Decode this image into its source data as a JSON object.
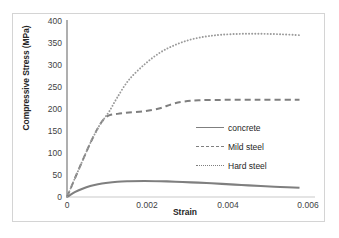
{
  "chart_data": {
    "type": "line",
    "title": "",
    "xlabel": "Strain",
    "ylabel": "Compressive Stress (MPa)",
    "xlim": [
      0,
      0.0064
    ],
    "ylim": [
      0,
      400
    ],
    "xticks": [
      "0",
      "0.002",
      "0.004",
      "0.006"
    ],
    "xtick_values": [
      0,
      0.002,
      0.004,
      0.006
    ],
    "yticks": [
      "0",
      "50",
      "100",
      "150",
      "200",
      "250",
      "300",
      "350",
      "400"
    ],
    "ytick_values": [
      0,
      50,
      100,
      150,
      200,
      250,
      300,
      350,
      400
    ],
    "grid": false,
    "legend_position": "center-right",
    "series": [
      {
        "name": "concrete",
        "style": "solid",
        "color": "#7f7f7f",
        "x": [
          0,
          0.0002,
          0.0004,
          0.0006,
          0.0008,
          0.001,
          0.0013,
          0.0016,
          0.002,
          0.0024,
          0.0028,
          0.0032,
          0.0036,
          0.004,
          0.0045,
          0.005,
          0.0055,
          0.006
        ],
        "y": [
          0,
          11,
          19,
          25,
          29,
          32,
          35,
          36,
          36.5,
          36,
          35,
          33.5,
          32,
          30,
          27.5,
          25,
          23,
          21
        ]
      },
      {
        "name": "Mild steel",
        "style": "dashed",
        "color": "#7f7f7f",
        "x": [
          0,
          0.0002,
          0.0004,
          0.0006,
          0.0008,
          0.00095,
          0.0011,
          0.0013,
          0.0016,
          0.002,
          0.0024,
          0.0027,
          0.003,
          0.0034,
          0.004,
          0.0046,
          0.0052,
          0.006
        ],
        "y": [
          0,
          42,
          83,
          123,
          158,
          178,
          187,
          190,
          193,
          196,
          203,
          212,
          218,
          221,
          222,
          222,
          222,
          222
        ]
      },
      {
        "name": "Hard steel",
        "style": "dotted",
        "color": "#9a9a9a",
        "x": [
          0,
          0.0002,
          0.0004,
          0.0006,
          0.0008,
          0.00095,
          0.0011,
          0.0013,
          0.0016,
          0.002,
          0.0024,
          0.0028,
          0.0032,
          0.0036,
          0.004,
          0.0045,
          0.005,
          0.0055,
          0.006
        ],
        "y": [
          0,
          42,
          83,
          123,
          158,
          178,
          197,
          228,
          268,
          303,
          330,
          348,
          360,
          367,
          371,
          373,
          373,
          372,
          370
        ]
      }
    ]
  },
  "legend": {
    "items": [
      {
        "label": "concrete"
      },
      {
        "label": "Mild steel"
      },
      {
        "label": "Hard steel"
      }
    ]
  },
  "colors": {
    "series_gray": "#7f7f7f",
    "axis_gray": "#808080",
    "text": "#262626",
    "frame_border": "#d4d4d4"
  }
}
